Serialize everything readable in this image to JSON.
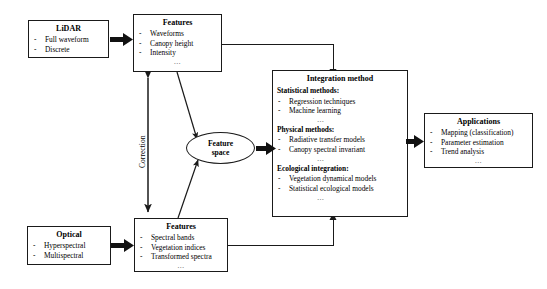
{
  "diagram": {
    "background_color": "#ffffff",
    "line_color": "#1a1a1a"
  },
  "nodes": {
    "lidar": {
      "title": "LiDAR",
      "items": [
        "Full waveform",
        "Discrete"
      ]
    },
    "lidar_features": {
      "title": "Features",
      "items": [
        "Waveforms",
        "Canopy height",
        "Intensity"
      ],
      "ellipsis": "…"
    },
    "optical": {
      "title": "Optical",
      "items": [
        "Hyperspectral",
        "Multispectral"
      ]
    },
    "optical_features": {
      "title": "Features",
      "items": [
        "Spectral bands",
        "Vegetation indices",
        "Transformed spectra"
      ],
      "ellipsis": "…"
    },
    "feature_space": {
      "line1": "Feature",
      "line2": "space"
    },
    "integration": {
      "title": "Integration method",
      "groups": [
        {
          "heading": "Statistical methods:",
          "items": [
            "Regression techniques",
            "Machine learning"
          ],
          "ellipsis": "…"
        },
        {
          "heading": "Physical methods:",
          "items": [
            "Radiative transfer models",
            "Canopy spectral invariant"
          ],
          "ellipsis": "…"
        },
        {
          "heading": "Ecological integration:",
          "items": [
            "Vegetation dynamical models",
            "Statistical ecological models"
          ],
          "ellipsis": "…"
        }
      ]
    },
    "applications": {
      "title": "Applications",
      "items": [
        "Mapping (classification)",
        "Parameter estimation",
        "Trend analysis"
      ],
      "ellipsis": "…"
    }
  },
  "connectors": {
    "correction_label": "Correction"
  }
}
